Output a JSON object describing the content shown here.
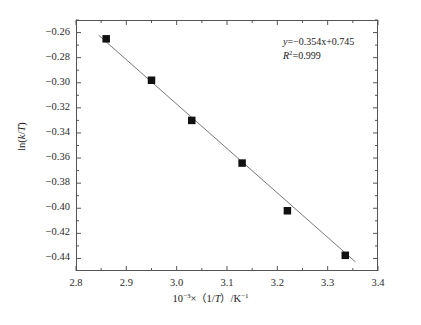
{
  "chart_data": {
    "type": "scatter",
    "title": "",
    "xlabel": "10^-3 x (1/T) /K^-1",
    "ylabel": "ln(k/T)",
    "xlim": [
      2.8,
      3.4
    ],
    "ylim": [
      -0.45,
      -0.25
    ],
    "xticks": [
      2.8,
      2.9,
      3.0,
      3.1,
      3.2,
      3.3,
      3.4
    ],
    "xticklabels": [
      "2.8",
      "2.9",
      "3.0",
      "3.1",
      "3.2",
      "3.3",
      "3.4"
    ],
    "yticks": [
      -0.26,
      -0.28,
      -0.3,
      -0.32,
      -0.34,
      -0.36,
      -0.38,
      -0.4,
      -0.42,
      -0.44
    ],
    "yticklabels": [
      "−0.26",
      "−0.28",
      "−0.30",
      "−0.32",
      "−0.34",
      "−0.36",
      "−0.38",
      "−0.40",
      "−0.42",
      "−0.44"
    ],
    "grid": false,
    "legend": null,
    "minor_ticks": true,
    "tick_direction": "in",
    "marker": "filled-square",
    "marker_color": "#111111",
    "line_color": "#777777",
    "x": [
      2.86,
      2.95,
      3.03,
      3.13,
      3.22,
      3.335
    ],
    "y": [
      -0.265,
      -0.298,
      -0.33,
      -0.364,
      -0.402,
      -0.4375
    ],
    "series": [
      {
        "name": "ln(k/T) vs 1000/T",
        "x": [
          2.86,
          2.95,
          3.03,
          3.13,
          3.22,
          3.335
        ],
        "values": [
          -0.265,
          -0.298,
          -0.33,
          -0.364,
          -0.402,
          -0.4375
        ]
      }
    ],
    "fit": {
      "type": "linear",
      "slope": -0.354,
      "intercept": 0.745,
      "r_squared": 0.999,
      "x_start": 2.845,
      "x_end": 3.355
    },
    "annotations": {
      "equation_y": "y",
      "equation_rest": "=−0.354x+0.745",
      "r2_symbol": "R",
      "r2_exp": "2",
      "r2_value": "=0.999"
    }
  },
  "axis": {
    "x_label_prefix": "10",
    "x_label_exp": "−3",
    "x_label_mid": "×（1/",
    "x_label_T": "T",
    "x_label_tail": "）/K",
    "x_label_exp2": "−1",
    "y_label_open": "ln(",
    "y_label_k": "k",
    "y_label_slash": "/",
    "y_label_T": "T",
    "y_label_close": ")"
  }
}
